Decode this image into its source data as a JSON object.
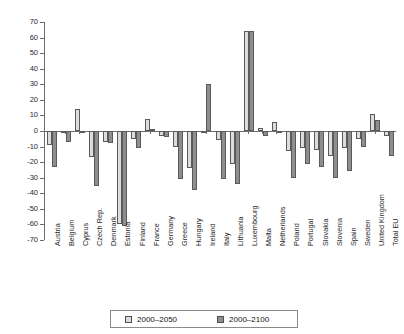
{
  "chart_data": {
    "type": "bar",
    "title": "",
    "subtitle": "",
    "xlabel": "",
    "ylabel": "",
    "ylim": [
      -70,
      70
    ],
    "ytick_step": 10,
    "yticks": [
      70,
      60,
      50,
      40,
      30,
      20,
      10,
      0,
      -10,
      -20,
      -30,
      -40,
      -50,
      -60,
      -70
    ],
    "ytick_labels": [
      "70",
      "60",
      "50",
      "40",
      "30",
      "20",
      "10",
      "0",
      "-10",
      "-20",
      "-30",
      "-40",
      "-50",
      "-60",
      "-70"
    ],
    "grid": false,
    "legend_position": "bottom-center",
    "categories": [
      "Austria",
      "Belgium",
      "Cyprus",
      "Czech Rep.",
      "Denmark",
      "Estonia",
      "Finland",
      "France",
      "Germany",
      "Greece",
      "Hungary",
      "Ireland",
      "Italy",
      "Lithuania",
      "Luxembourg",
      "Malta",
      "Netherlands",
      "Poland",
      "Portugal",
      "Slovakia",
      "Slovenia",
      "Spain",
      "Sweden",
      "United Kingdom",
      "Total EU"
    ],
    "series": [
      {
        "name": "2000–2050",
        "color": "#dcdcdc",
        "values": [
          -9,
          -1,
          14,
          -17,
          -7,
          -60,
          -5,
          8,
          -3,
          -10,
          -24,
          -1,
          -6,
          -21,
          64,
          2,
          6,
          -13,
          -11,
          -12,
          -16,
          -11,
          -5,
          11,
          -3
        ]
      },
      {
        "name": "2000–2100",
        "color": "#8e8e8e",
        "values": [
          -23,
          -7,
          -1,
          -35,
          -8,
          -61,
          -11,
          1,
          -4,
          -31,
          -38,
          30,
          -31,
          -34,
          64,
          -3,
          -0.5,
          -30,
          -21,
          -23,
          -30,
          -26,
          -10,
          7,
          -16
        ]
      }
    ]
  },
  "legend": {
    "items": [
      {
        "label": "2000–2050",
        "swatch": "s0"
      },
      {
        "label": "2000–2100",
        "swatch": "s1"
      }
    ]
  },
  "colors": {
    "series_2000_2050": "#dcdcdc",
    "series_2000_2100": "#8e8e8e",
    "axis": "#6d6d6d",
    "background": "#ffffff",
    "text": "#1a1a1a"
  }
}
